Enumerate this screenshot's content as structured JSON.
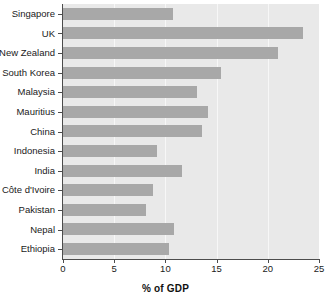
{
  "chart_data": {
    "type": "bar",
    "orientation": "horizontal",
    "title": "",
    "xlabel": "% of GDP",
    "ylabel": "",
    "xlim": [
      0,
      25
    ],
    "ylim": null,
    "xticks": [
      0,
      5,
      10,
      15,
      20,
      25
    ],
    "xtick_labels": [
      "0",
      "5",
      "10",
      "15",
      "20",
      "25"
    ],
    "grid": "vertical",
    "legend": null,
    "bar_color": "#a8a8a8",
    "plot_background": "#e9e9e9",
    "categories": [
      "Singapore",
      "UK",
      "New Zealand",
      "South Korea",
      "Malaysia",
      "Mauritius",
      "China",
      "Indonesia",
      "India",
      "Côte d'Ivoire",
      "Pakistan",
      "Nepal",
      "Ethiopia"
    ],
    "values": [
      10.7,
      23.4,
      21.0,
      15.4,
      13.1,
      14.2,
      13.6,
      9.2,
      11.6,
      8.8,
      8.1,
      10.8,
      10.4
    ]
  }
}
